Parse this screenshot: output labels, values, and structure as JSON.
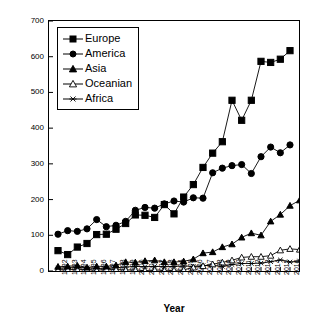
{
  "chart_data": {
    "type": "line",
    "title": "",
    "xlabel": "Year",
    "ylabel": "Number of articles",
    "ylim": [
      0,
      700
    ],
    "ytick_step": 100,
    "yticks": [
      0,
      100,
      200,
      300,
      400,
      500,
      600,
      700
    ],
    "grid": false,
    "legend_position": "upper-left-inside",
    "categories": [
      "1992",
      "1993",
      "1994",
      "1995",
      "1996",
      "1997",
      "1998",
      "1999",
      "2000",
      "2001",
      "2002",
      "2003",
      "2004",
      "2005",
      "2006",
      "2007",
      "2008",
      "2009",
      "2010",
      "2011",
      "2012",
      "2013",
      "2014",
      "2015",
      "2016"
    ],
    "x": [
      1992,
      1993,
      1994,
      1995,
      1996,
      1997,
      1998,
      1999,
      2000,
      2001,
      2002,
      2003,
      2004,
      2005,
      2006,
      2007,
      2008,
      2009,
      2010,
      2011,
      2012,
      2013,
      2014,
      2015,
      2016
    ],
    "series": [
      {
        "name": "Europe",
        "marker": "filled-square",
        "color": "#000000",
        "values": [
          57,
          46,
          67,
          77,
          102,
          103,
          117,
          133,
          157,
          156,
          150,
          186,
          160,
          207,
          242,
          290,
          330,
          362,
          478,
          422,
          478,
          587,
          584,
          593,
          617
        ]
      },
      {
        "name": "America",
        "marker": "filled-circle",
        "color": "#000000",
        "values": [
          103,
          113,
          111,
          118,
          144,
          124,
          128,
          139,
          170,
          178,
          176,
          188,
          196,
          193,
          205,
          204,
          275,
          288,
          295,
          298,
          273,
          320,
          347,
          331,
          353
        ]
      },
      {
        "name": "Asia",
        "marker": "filled-triangle",
        "color": "#000000",
        "values": [
          12,
          13,
          15,
          10,
          13,
          13,
          16,
          25,
          24,
          28,
          30,
          25,
          25,
          27,
          33,
          50,
          53,
          67,
          75,
          94,
          106,
          100,
          139,
          158,
          183
        ]
      },
      {
        "name": "Oceanian",
        "marker": "open-triangle",
        "color": "#000000",
        "values": [
          3,
          4,
          4,
          4,
          2,
          5,
          4,
          3,
          3,
          1,
          3,
          2,
          2,
          3,
          10,
          14,
          19,
          24,
          30,
          38,
          40,
          40,
          43,
          58,
          62
        ]
      },
      {
        "name": "Africa",
        "marker": "star",
        "color": "#000000",
        "values": [
          8,
          9,
          10,
          9,
          7,
          8,
          9,
          11,
          13,
          12,
          13,
          12,
          13,
          14,
          13,
          15,
          16,
          13,
          18,
          21,
          21,
          22,
          26,
          31,
          25
        ]
      }
    ],
    "series_tail": {
      "Asia": 198,
      "Oceanian": 60,
      "Africa": 28
    }
  },
  "axis": {
    "y_title": "Number of articles",
    "x_title": "Year"
  },
  "legend": {
    "items": [
      {
        "label": "Europe"
      },
      {
        "label": "America"
      },
      {
        "label": "Asia"
      },
      {
        "label": "Oceanian"
      },
      {
        "label": "Africa"
      }
    ]
  }
}
